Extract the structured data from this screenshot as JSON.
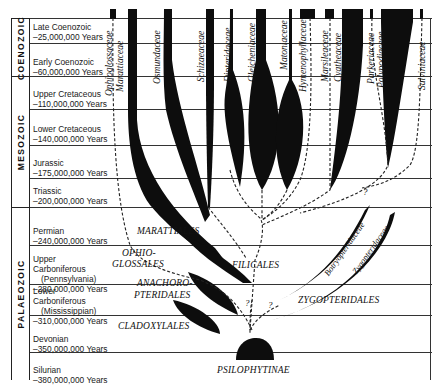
{
  "eras": [
    {
      "name": "COENOZOIC",
      "top": 18,
      "bottom": 76
    },
    {
      "name": "MESOZOIC",
      "top": 76,
      "bottom": 207
    },
    {
      "name": "PALAEOZOIC",
      "top": 207,
      "bottom": 380
    }
  ],
  "periods": [
    {
      "name": "Late Coenozoic",
      "age": "–25,000,000 Years"
    },
    {
      "name": "Early Coenozoic",
      "age": "–60,000,000 Years"
    },
    {
      "name": "Upper Cretaceous",
      "age": "–110,000,000 Years"
    },
    {
      "name": "Lower Cretaceous",
      "age": "–140,000,000 Years"
    },
    {
      "name": "Jurassic",
      "age": "–175,000,000 Years"
    },
    {
      "name": "Triassic",
      "age": "–200,000,000 Years"
    },
    {
      "name": "Permian",
      "age": "–240,000,000 Years"
    },
    {
      "name": "Upper Carboniferous",
      "sub": "(Pennsylvania)",
      "age": "–280,000,000 Years"
    },
    {
      "name": "Lower Carboniferous",
      "sub": "(Mississippian)",
      "age": "–310,000,000 Years"
    },
    {
      "name": "Devonian",
      "age": "–350,000,000 Years"
    },
    {
      "name": "Silurian",
      "age": "–380,000,000 Years"
    }
  ],
  "families": [
    "Ophioglossaceae",
    "Marattiaceae",
    "Osmundaceae",
    "Schizaeaceae",
    "Dipteridaceae",
    "Gleicheniaceae",
    "Matoniaceae",
    "Hymenophyllaceae",
    "Marsileaceae",
    "Cyatheaceae",
    "Parkeriaceae",
    "Polypodiaceae",
    "Salviniaceae",
    "Botryopteridaceae",
    "Zygopteridaceae"
  ],
  "orders": {
    "marattiales": "MARATTIALES",
    "ophioglossales_1": "OPHIO-",
    "ophioglossales_2": "GLOSSALES",
    "filicales": "FILICALES",
    "anachoropteridales_1": "ANACHORO-",
    "anachoropteridales_2": "PTERIDALES",
    "zygopteridales": "ZYGOPTERIDALES",
    "cladoxylales": "CLADOXYLALES",
    "psilophytinae": "PSILOPHYTINAE"
  },
  "uncertain_marks": [
    "?",
    "?",
    "?"
  ],
  "colors": {
    "ink": "#111111",
    "background": "#ffffff",
    "rule": "#333333"
  }
}
